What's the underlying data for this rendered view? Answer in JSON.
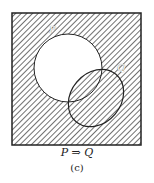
{
  "diagram": {
    "type": "venn",
    "sets": [
      {
        "name": "P",
        "label": "P"
      },
      {
        "name": "Q",
        "label": "Q"
      }
    ],
    "shaded_region": "complement of (P minus Q)",
    "caption": "P ⇒ Q",
    "subcaption": "(c)"
  },
  "colors": {
    "hatch": "#333333",
    "outline": "#222222",
    "background": "#ffffff"
  }
}
